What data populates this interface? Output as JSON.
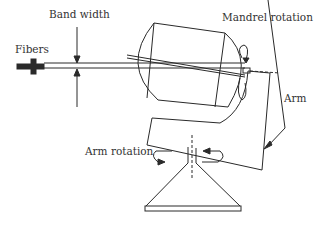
{
  "diagram": {
    "type": "filament-winding-machine",
    "labels": {
      "band_width": "Band width",
      "fibers": "Fibers",
      "mandrel_rotation": "Mandrel rotation",
      "arm": "Arm",
      "arm_rotation": "Arm rotation"
    },
    "colors": {
      "line": "#2a2a2a",
      "text": "#333333",
      "background": "#ffffff"
    }
  }
}
